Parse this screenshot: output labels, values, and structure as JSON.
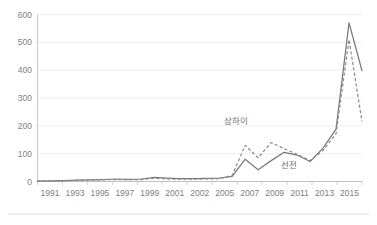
{
  "chart_data": {
    "type": "line",
    "title": "",
    "subtitle": "",
    "xlabel": "",
    "ylabel": "",
    "xlim": [
      1991,
      2016
    ],
    "ylim": [
      0,
      600
    ],
    "grid": true,
    "legend_position": "inline-annotations",
    "y_ticks": [
      0,
      100,
      200,
      300,
      400,
      500,
      600
    ],
    "y_tick_labels": [
      "0",
      "100",
      "200",
      "300",
      "400",
      "500",
      "600"
    ],
    "x_tick_labels": [
      "1991",
      "1993",
      "1995",
      "1997",
      "1999",
      "2001",
      "2002",
      "2005",
      "2007",
      "2009",
      "2011",
      "2013",
      "2015"
    ],
    "x": [
      1991,
      1992,
      1993,
      1994,
      1995,
      1996,
      1997,
      1998,
      1999,
      2000,
      2001,
      2002,
      2003,
      2004,
      2005,
      2006,
      2007,
      2008,
      2009,
      2010,
      2011,
      2012,
      2013,
      2014,
      2015,
      2016
    ],
    "series": [
      {
        "name": "선전",
        "style": "solid",
        "color": "#7a7a7a",
        "values": [
          1,
          2,
          3,
          5,
          6,
          7,
          9,
          8,
          9,
          15,
          12,
          10,
          10,
          11,
          12,
          18,
          80,
          42,
          75,
          105,
          95,
          72,
          120,
          188,
          570,
          398
        ]
      },
      {
        "name": "상하이",
        "style": "dashed",
        "color": "#8a8a8a",
        "values": [
          1,
          1,
          2,
          4,
          5,
          6,
          7,
          6,
          7,
          11,
          9,
          8,
          8,
          9,
          10,
          22,
          130,
          85,
          140,
          118,
          98,
          75,
          112,
          172,
          510,
          215
        ]
      }
    ],
    "annotations": [
      {
        "text": "상하이",
        "x": 2006.3,
        "y": 205
      },
      {
        "text": "선전",
        "x": 2010.4,
        "y": 48
      }
    ]
  },
  "colors": {
    "gridline": "#e8e8e8",
    "axis": "#bfbfbf",
    "tick_text": "#808080",
    "series_solid": "#7a7a7a",
    "series_dashed": "#8a8a8a",
    "background": "#ffffff",
    "footer_rule": "#d6d6d6"
  }
}
